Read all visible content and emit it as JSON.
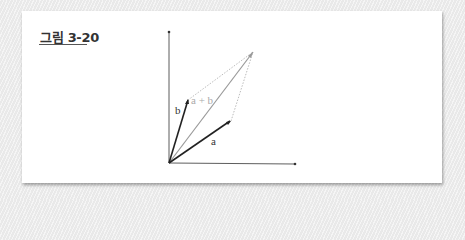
{
  "figure": {
    "title": "그림 3-20",
    "labels": {
      "a": "a",
      "b": "b",
      "sum": "a + b"
    },
    "colors": {
      "vector": "#222222",
      "sum_vector": "#999999",
      "dotted": "#aaaaaa",
      "axis": "#333333"
    }
  }
}
